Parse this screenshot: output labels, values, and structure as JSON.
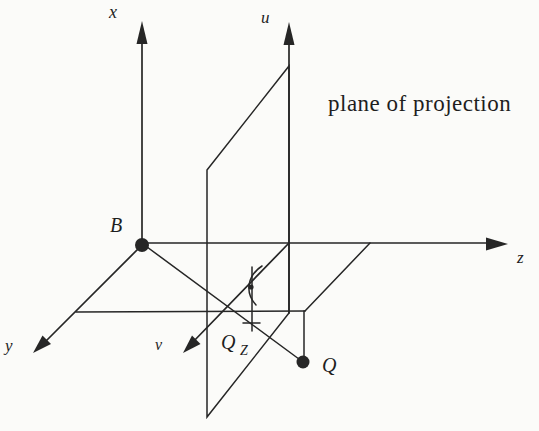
{
  "figure": {
    "type": "3d-projection-diagram",
    "background_color": "#fbfbf9",
    "ink_color": "#262626"
  },
  "caption": {
    "plane": "plane of projection"
  },
  "axes": {
    "x": {
      "label": "x"
    },
    "y": {
      "label": "y"
    },
    "z": {
      "label": "z"
    },
    "u": {
      "label": "u"
    },
    "v": {
      "label": "v"
    }
  },
  "points": {
    "b": {
      "label": "B",
      "marker": "filled-dot"
    },
    "q": {
      "label": "Q",
      "marker": "filled-dot"
    },
    "qz_main": "Q",
    "qz_sub": "Z",
    "qz_marker": "cross"
  },
  "annotations": {
    "right_angle_mark": "arc-with-dot"
  }
}
